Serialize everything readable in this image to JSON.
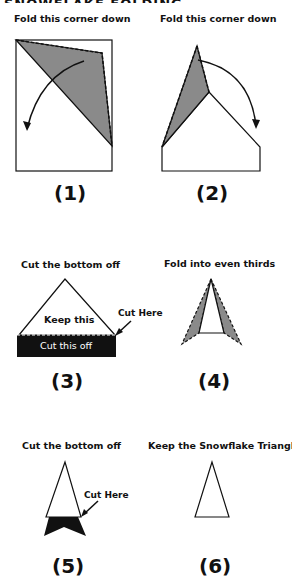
{
  "header": {
    "title_cropped": "SNOWFLAKE FOLDING INSTRUCTIONS"
  },
  "steps": [
    {
      "number": "(1)",
      "caption": "Fold this corner down"
    },
    {
      "number": "(2)",
      "caption": "Fold this corner down"
    },
    {
      "number": "(3)",
      "caption": "Cut the bottom off",
      "keep_label": "Keep this",
      "cut_label": "Cut this off",
      "cut_here": "Cut Here"
    },
    {
      "number": "(4)",
      "caption": "Fold into even thirds"
    },
    {
      "number": "(5)",
      "caption": "Cut the bottom off",
      "cut_here": "Cut Here"
    },
    {
      "number": "(6)",
      "caption": "Keep the Snowflake Triangle"
    }
  ],
  "colors": {
    "shade": "#8a8a8a",
    "line": "#111111",
    "cut": "#111111"
  }
}
